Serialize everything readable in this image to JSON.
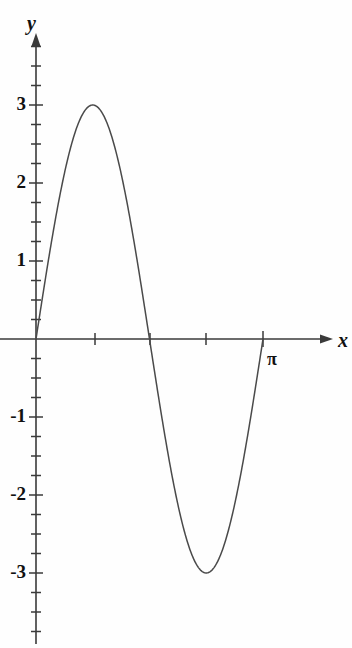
{
  "figure": {
    "name": "sine-graph",
    "background_color": "#fefefe",
    "line_color": "#4a4a4a",
    "axis_color": "#3a3a3a",
    "text_color": "#111111"
  },
  "chart_data": {
    "type": "line",
    "title": "",
    "subtitle": "",
    "xlabel": "x",
    "ylabel": "y",
    "function": "y = 3 sin(2x)",
    "xlim": [
      0,
      3.4557519189487724
    ],
    "ylim": [
      -3.85,
      3.85
    ],
    "grid": false,
    "legend": null,
    "axis_style": "arrowed-cartesian",
    "x_tick_labels": [
      "",
      "",
      "",
      "π"
    ],
    "x_tick_values": [
      0.7853981633974483,
      1.5707963267948966,
      2.356194490192345,
      3.141592653589793
    ],
    "y_tick_labels": [
      "3",
      "2",
      "1",
      "-1",
      "-2",
      "-3"
    ],
    "y_tick_values": [
      3,
      2,
      1,
      -1,
      -2,
      -3
    ],
    "y_minor_tick_step": 0.25,
    "annotations": [
      {
        "text": "π",
        "x": 3.141592653589793,
        "y": -0.35
      },
      {
        "text": "y",
        "position": "y-axis-top"
      },
      {
        "text": "x",
        "position": "x-axis-right"
      }
    ],
    "series": [
      {
        "name": "3 sin(2x)",
        "color": "#4a4a4a",
        "x": [
          0,
          0.0785,
          0.1571,
          0.2356,
          0.3142,
          0.3927,
          0.4712,
          0.5498,
          0.6283,
          0.7069,
          0.7854,
          0.8639,
          0.9425,
          1.021,
          1.0996,
          1.1781,
          1.2566,
          1.3352,
          1.4137,
          1.4923,
          1.5708,
          1.6493,
          1.7279,
          1.8064,
          1.885,
          1.9635,
          2.042,
          2.1206,
          2.1991,
          2.2777,
          2.3562,
          2.4347,
          2.5133,
          2.5918,
          2.6704,
          2.7489,
          2.8274,
          2.906,
          2.9845,
          3.0631,
          3.1416
        ],
        "y": [
          0,
          0.4679,
          0.9271,
          1.3693,
          1.7634,
          2.1213,
          2.4271,
          2.6631,
          2.8532,
          2.9634,
          3.0,
          2.9634,
          2.8532,
          2.6631,
          2.4271,
          2.1213,
          1.7634,
          1.3693,
          0.9271,
          0.4679,
          0.0,
          -0.4679,
          -0.9271,
          -1.3693,
          -1.7634,
          -2.1213,
          -2.4271,
          -2.6631,
          -2.8532,
          -2.9634,
          -3.0,
          -2.9634,
          -2.8532,
          -2.6631,
          -2.4271,
          -2.1213,
          -1.7634,
          -1.3693,
          -0.9271,
          -0.4679,
          0.0
        ]
      }
    ],
    "key_points": {
      "maximum": {
        "x": 0.7853981633974483,
        "y": 3,
        "label": "peak at π/4"
      },
      "minimum": {
        "x": 2.356194490192345,
        "y": -3,
        "label": "trough at 3π/4"
      },
      "zeros": [
        0,
        1.5707963267948966,
        3.141592653589793
      ]
    }
  }
}
